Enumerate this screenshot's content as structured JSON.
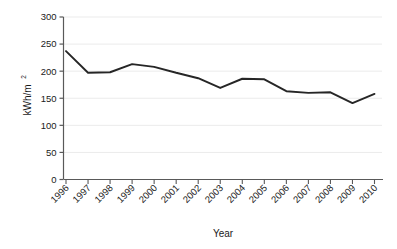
{
  "chart_data": {
    "type": "line",
    "title": "",
    "subtitle": "",
    "xlabel": "Year",
    "ylabel": "kWh/m²",
    "categories": [
      "1996",
      "1997",
      "1998",
      "1999",
      "2000",
      "2001",
      "2002",
      "2003",
      "2004",
      "2005",
      "2006",
      "2007",
      "2008",
      "2009",
      "2010"
    ],
    "values": [
      237,
      197,
      198,
      213,
      208,
      197,
      187,
      169,
      186,
      185,
      163,
      160,
      161,
      141,
      158
    ],
    "series": [
      {
        "name": "Energy intensity",
        "values": [
          237,
          197,
          198,
          213,
          208,
          197,
          187,
          169,
          186,
          185,
          163,
          160,
          161,
          141,
          158
        ]
      }
    ],
    "ylim": [
      0,
      300
    ],
    "yticks": [
      0,
      50,
      100,
      150,
      200,
      250,
      300
    ],
    "ytick_labels": [
      "0",
      "50",
      "100",
      "150",
      "200",
      "250",
      "300"
    ],
    "grid": true,
    "grid_axis": "y",
    "legend": false,
    "legend_position": "none",
    "line_color": "#262626",
    "grid_color": "#ebebeb",
    "axis_color": "#595959",
    "background_color": "#ffffff",
    "xtick_rotation": 45
  },
  "axes": {
    "y_label_main": "kWh/m",
    "y_label_sup": "2",
    "x_title": "Year"
  }
}
